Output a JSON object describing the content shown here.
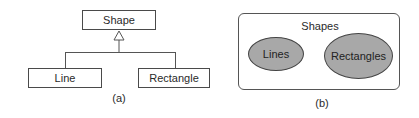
{
  "diagram_a": {
    "parent": {
      "label": "Shape"
    },
    "children": [
      {
        "label": "Line"
      },
      {
        "label": "Rectangle"
      }
    ],
    "relationship": "generalization (hollow triangle arrow)",
    "caption": "(a)"
  },
  "diagram_b": {
    "container": {
      "label": "Shapes"
    },
    "sets": [
      {
        "label": "Lines"
      },
      {
        "label": "Rectangles"
      }
    ],
    "caption": "(b)"
  },
  "colors": {
    "stroke": "#4a4a4a",
    "ellipse_fill": "#a8a8a8",
    "background": "#ffffff"
  }
}
